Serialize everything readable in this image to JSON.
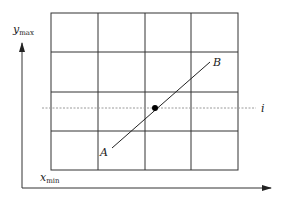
{
  "diagram": {
    "type": "raster-grid-line-intersection",
    "colors": {
      "grid": "#333333",
      "axis": "#333333",
      "scanline": "#9a9a9a",
      "segment": "#222222",
      "point": "#000000",
      "background": "#ffffff"
    },
    "grid": {
      "columns": 4,
      "rows": 4
    },
    "labels": {
      "y_axis": "y",
      "y_axis_sub": "max",
      "x_axis": "x",
      "x_axis_sub": "min",
      "point_a": "A",
      "point_b": "B",
      "scanline": "i"
    }
  }
}
